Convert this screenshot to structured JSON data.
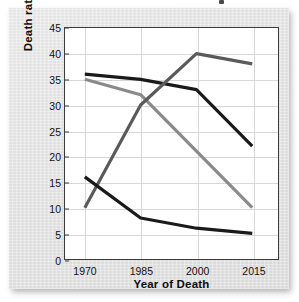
{
  "chart_data": {
    "type": "line",
    "title": "",
    "xlabel": "Year of Death",
    "ylabel": "Death rate per 100,000",
    "categories": [
      "1970",
      "1985",
      "2000",
      "2015"
    ],
    "x": [
      1970,
      1985,
      2000,
      2015
    ],
    "xticks": [
      "1970",
      "1985",
      "2000",
      "2015"
    ],
    "yticks": [
      "0",
      "5",
      "10",
      "15",
      "20",
      "25",
      "30",
      "35",
      "40",
      "45"
    ],
    "ylim": [
      0,
      45
    ],
    "ytick_step": 5,
    "grid": "horizontal-and-vertical",
    "legend": "none",
    "series": [
      {
        "name": "series-1",
        "color": "#1a1a1a",
        "values": [
          36,
          35,
          33,
          22
        ]
      },
      {
        "name": "series-2",
        "color": "#8a8a8a",
        "values": [
          35,
          32,
          21,
          10
        ]
      },
      {
        "name": "series-3",
        "color": "#5a5a5a",
        "values": [
          10,
          30,
          40,
          38
        ]
      },
      {
        "name": "series-4",
        "color": "#1a1a1a",
        "values": [
          16,
          8,
          6,
          5
        ]
      }
    ]
  },
  "style": {
    "panel_background": "#e4e4e4",
    "plot_background": "#ffffff",
    "axis_color": "#3c3c3c",
    "grid_color": "#d7d7d7",
    "text_color": "#111111",
    "line_width": 3.2
  },
  "artifacts": {
    "top_speck": "dark-speck"
  }
}
